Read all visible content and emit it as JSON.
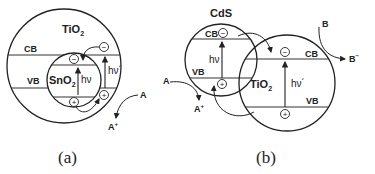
{
  "panel_a": {
    "caption": "(a)",
    "outer_material": "TiO",
    "outer_sub": "2",
    "inner_material": "SnO",
    "inner_sub": "2",
    "cb_label": "CB",
    "vb_label": "VB",
    "hv_inner": "hν",
    "hv_outer": "hν´",
    "electron": "−",
    "hole": "+",
    "reactant": "A",
    "product": "A",
    "product_sup": "+"
  },
  "panel_b": {
    "caption": "(b)",
    "left_material": "CdS",
    "right_material": "TiO",
    "right_sub": "2",
    "cb_label": "CB",
    "vb_label": "VB",
    "hv_left": "hν",
    "hv_right": "hν´",
    "electron": "−",
    "hole": "+",
    "reactant_a": "A",
    "product_a": "A",
    "product_a_sup": "+",
    "reactant_b": "B",
    "product_b": "B",
    "product_b_sup": "−"
  }
}
